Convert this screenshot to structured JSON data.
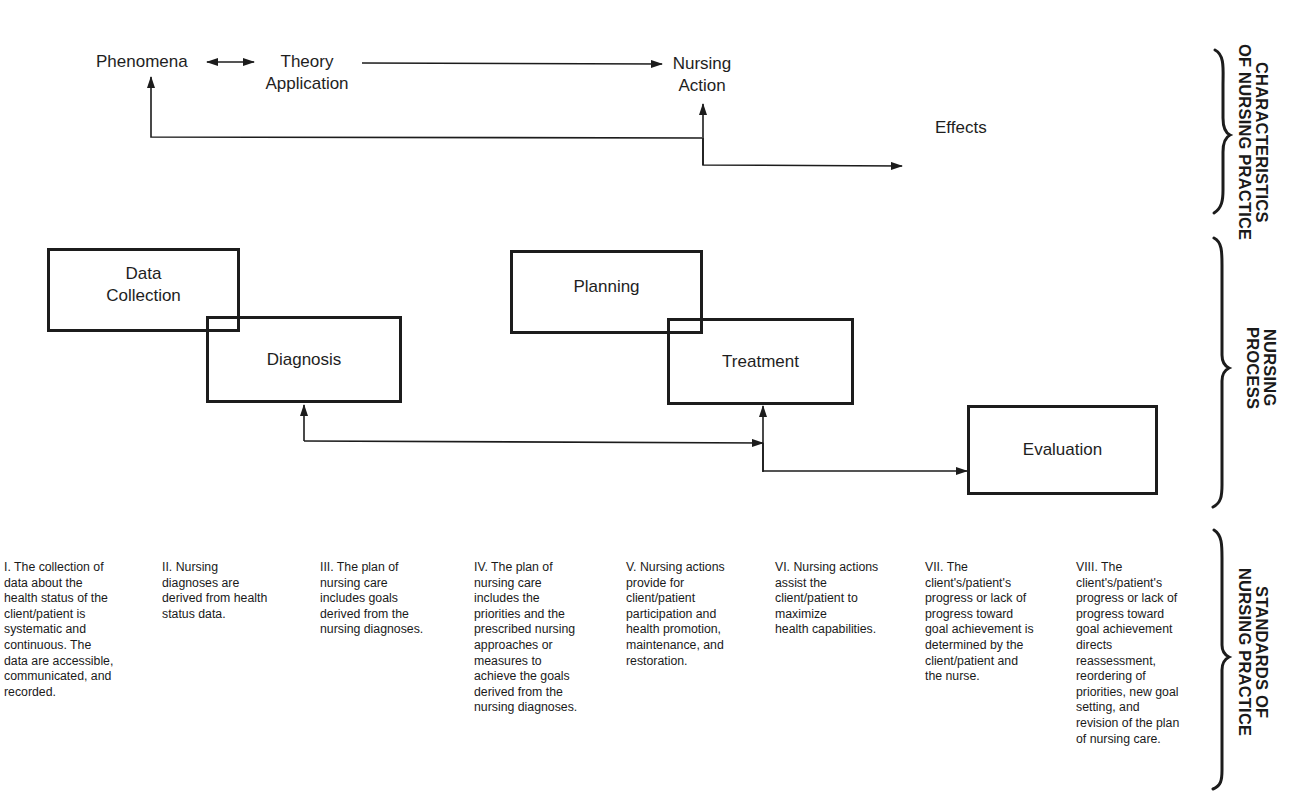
{
  "characteristics": {
    "phenomena": "Phenomena",
    "theory_application": "Theory\nApplication",
    "theory_line1": "Theory",
    "theory_line2": "Application",
    "nursing_action_line1": "Nursing",
    "nursing_action_line2": "Action",
    "effects": "Effects"
  },
  "nursing_process": {
    "boxes": [
      {
        "id": "data-collection",
        "line1": "Data",
        "line2": "Collection"
      },
      {
        "id": "diagnosis",
        "label": "Diagnosis"
      },
      {
        "id": "planning",
        "label": "Planning"
      },
      {
        "id": "treatment",
        "label": "Treatment"
      },
      {
        "id": "evaluation",
        "label": "Evaluation"
      }
    ]
  },
  "standards": [
    {
      "numeral": "I",
      "text": "I. The collection of\ndata about the\nhealth status of the\nclient/patient is\nsystematic and\ncontinuous. The\ndata are accessible,\ncommunicated, and\nrecorded."
    },
    {
      "numeral": "II",
      "text": "II. Nursing\ndiagnoses are\nderived from health\nstatus data."
    },
    {
      "numeral": "III",
      "text": "III. The plan of\nnursing care\nincludes goals\nderived from the\nnursing diagnoses."
    },
    {
      "numeral": "IV",
      "text": "IV. The plan of\nnursing care\nincludes the\npriorities and the\nprescribed nursing\napproaches or\nmeasures to\nachieve the goals\nderived from the\nnursing diagnoses."
    },
    {
      "numeral": "V",
      "text": "V. Nursing actions\nprovide for\nclient/patient\nparticipation and\nhealth promotion,\nmaintenance, and\nrestoration."
    },
    {
      "numeral": "VI",
      "text": "VI. Nursing actions\nassist the\nclient/patient to\nmaximize\nhealth capabilities."
    },
    {
      "numeral": "VII",
      "text": "VII. The\nclient's/patient's\nprogress or lack of\nprogress toward\ngoal achievement is\ndetermined by the\nclient/patient and\nthe nurse."
    },
    {
      "numeral": "VIII",
      "text": "VIII. The\nclient's/patient's\nprogress or lack of\nprogress toward\ngoal achievement\ndirects\nreassessment,\nreordering of\npriorities, new goal\nsetting, and\nrevision of the plan\nof nursing care."
    }
  ],
  "side_labels": {
    "characteristics": "CHARACTERISTICS\nOF NURSING PRACTICE",
    "nursing_process": "NURSING\nPROCESS",
    "standards": "STANDARDS OF\nNURSING PRACTICE"
  },
  "colors": {
    "ink": "#1c1c1c",
    "background": "#ffffff"
  }
}
